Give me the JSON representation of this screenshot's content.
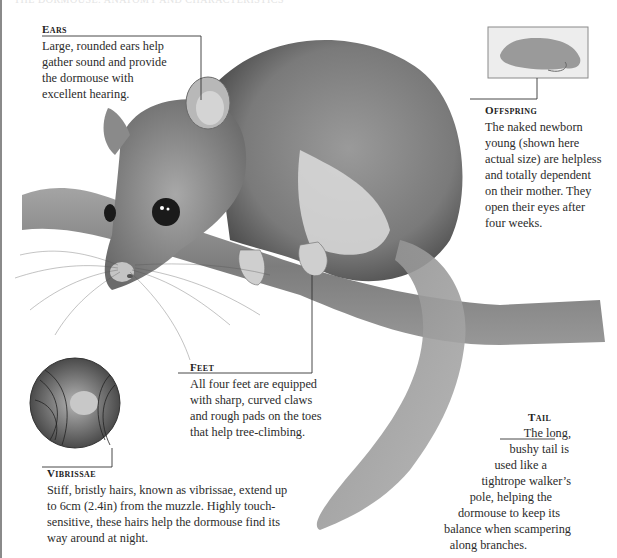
{
  "page": {
    "top_faded_text": "THE DORMOUSE: ANATOMY AND CHARACTERISTICS"
  },
  "callouts": {
    "ears": {
      "heading": "Ears",
      "lines": [
        "Large, rounded ears help",
        "gather sound and provide",
        "the dormouse with",
        "excellent hearing."
      ]
    },
    "offspring": {
      "heading": "Offspring",
      "lines": [
        "The naked newborn",
        "young (shown here",
        "actual size) are helpless",
        "and totally dependent",
        "on their mother. They",
        "open their eyes after",
        "four weeks."
      ]
    },
    "feet": {
      "heading": "Feet",
      "lines": [
        "All four feet are equipped",
        "with sharp, curved claws",
        "and rough pads on the toes",
        "that help tree-climbing."
      ]
    },
    "vibrissae": {
      "heading": "Vibrissae",
      "lines": [
        "Stiff, bristly hairs, known as vibrissae, extend up",
        "to 6cm (2.4in) from the muzzle. Highly touch-",
        "sensitive, these hairs help the dormouse find its",
        "way around at night."
      ]
    },
    "tail": {
      "heading": "Tail",
      "lines": [
        "The long,",
        "bushy tail is",
        "used like a",
        "tightrope walker’s",
        "pole, helping the",
        "dormouse to keep its",
        "balance when scampering",
        "along branches."
      ]
    }
  },
  "illustration": {
    "subject": "edible dormouse on branch",
    "inset_offspring": "newborn dormouse",
    "inset_vibrissae": "muzzle close-up with whiskers",
    "colors": {
      "fur_dark": "#5a5a5a",
      "fur_mid": "#8c8c8c",
      "fur_light": "#c8c8c8",
      "belly": "#e6e6e6",
      "branch": "#7a7a7a"
    }
  }
}
